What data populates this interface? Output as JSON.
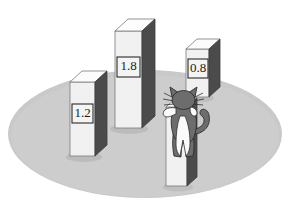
{
  "figure": {
    "name": "3d-bar-chart-with-cat",
    "background_color": "#ffffff",
    "platform": {
      "name": "elliptical-platform",
      "color": "#c9c9c9",
      "shadow_color": "#bcbcbc",
      "cx": 145,
      "cy": 134,
      "rx": 137,
      "ry": 64
    },
    "palette": {
      "bar_front": "#f1f1f1",
      "bar_top": "#fcfcfc",
      "bar_side": "#4b4b4b",
      "bar_outline": "#6e6e6e",
      "label_box_fill": "#f4f4f4",
      "label_box_border": "#2b2b2b",
      "label_text": "#1a1a1a",
      "cat_body": "#6d6d6d",
      "cat_belly": "#fafafa",
      "cat_outline": "#2f2f2f"
    }
  },
  "chart_data": {
    "type": "bar",
    "title": "",
    "subtitle": "",
    "xlabel": "",
    "ylabel": "",
    "grid": false,
    "legend": "none",
    "note": "Stylized 3D bar chart on an elliptical platform; a cat climbs the fourth, unlabeled bar.",
    "categories": [
      "bar-1",
      "bar-2",
      "bar-3",
      "bar-4"
    ],
    "values": [
      1.2,
      1.8,
      0.8,
      null
    ],
    "data_labels": [
      "1.2",
      "1.8",
      "0.8",
      ""
    ],
    "ylim": [
      0,
      2.0
    ],
    "bars": [
      {
        "id": "bar-1",
        "label": "1.2",
        "value": 1.2,
        "has_label": true,
        "front": {
          "x": 70,
          "y": 82,
          "w": 25,
          "h": 74
        },
        "depth_x": 12,
        "depth_y": -11,
        "label_box": {
          "x": 72,
          "y": 104,
          "w": 21,
          "h": 19
        }
      },
      {
        "id": "bar-2",
        "label": "1.8",
        "value": 1.8,
        "has_label": true,
        "front": {
          "x": 115,
          "y": 31,
          "w": 27,
          "h": 97
        },
        "depth_x": 13,
        "depth_y": -12,
        "label_box": {
          "x": 117,
          "y": 57,
          "w": 23,
          "h": 20
        }
      },
      {
        "id": "bar-3",
        "label": "0.8",
        "value": 0.8,
        "has_label": true,
        "front": {
          "x": 186,
          "y": 49,
          "w": 23,
          "h": 48
        },
        "depth_x": 11,
        "depth_y": -10,
        "label_box": {
          "x": 188,
          "y": 59,
          "w": 20,
          "h": 19
        }
      },
      {
        "id": "bar-4",
        "label": "",
        "value": null,
        "has_label": false,
        "front": {
          "x": 166,
          "y": 107,
          "w": 21,
          "h": 79
        },
        "depth_x": 10,
        "depth_y": -9,
        "label_box": null
      }
    ]
  },
  "cat": {
    "name": "cat-figure",
    "description": "gray cat climbing the fourth bar",
    "body_color": "#6d6d6d",
    "belly_color": "#fafafa",
    "outline_color": "#2f2f2f",
    "parts": [
      "head",
      "ears",
      "whiskers",
      "front-paws",
      "body",
      "belly",
      "hind-legs",
      "tail"
    ]
  }
}
